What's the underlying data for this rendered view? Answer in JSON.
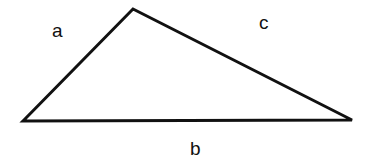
{
  "diagram": {
    "type": "triangle",
    "stroke_color": "#111111",
    "background": "#ffffff",
    "vertices": [
      {
        "x": 23,
        "y": 121
      },
      {
        "x": 133,
        "y": 9
      },
      {
        "x": 352,
        "y": 120
      }
    ],
    "sides": [
      {
        "name": "a",
        "label": "a",
        "label_x": 58,
        "label_y": 37
      },
      {
        "name": "c",
        "label": "c",
        "label_x": 265,
        "label_y": 29
      },
      {
        "name": "b",
        "label": "b",
        "label_x": 196,
        "label_y": 154
      }
    ]
  }
}
